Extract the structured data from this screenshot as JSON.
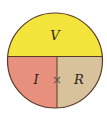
{
  "diagram": {
    "title": "",
    "type": "ohms-law-circle",
    "segments": {
      "top": {
        "label": "V",
        "color": "#f2e43a"
      },
      "bottom_left": {
        "label": "I",
        "color": "#e8907e"
      },
      "bottom_right": {
        "label": "R",
        "color": "#d8c29c"
      }
    },
    "operator": "×",
    "outline_color": "#5a3a28"
  }
}
